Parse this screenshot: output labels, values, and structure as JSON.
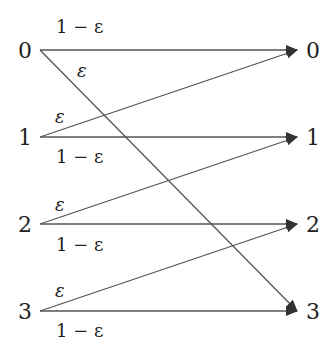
{
  "diagram": {
    "type": "channel-transition-diagram",
    "inputs": [
      "0",
      "1",
      "2",
      "3"
    ],
    "outputs": [
      "0",
      "1",
      "2",
      "3"
    ],
    "edges": [
      {
        "from": "0",
        "to": "0",
        "label": "1 − ε"
      },
      {
        "from": "0",
        "to": "3",
        "label": "ε"
      },
      {
        "from": "1",
        "to": "0",
        "label": "ε"
      },
      {
        "from": "1",
        "to": "1",
        "label": "1 − ε"
      },
      {
        "from": "2",
        "to": "1",
        "label": "ε"
      },
      {
        "from": "2",
        "to": "2",
        "label": "1 − ε"
      },
      {
        "from": "3",
        "to": "2",
        "label": "ε"
      },
      {
        "from": "3",
        "to": "3",
        "label": "1 − ε"
      }
    ],
    "line_color": "#444444"
  }
}
